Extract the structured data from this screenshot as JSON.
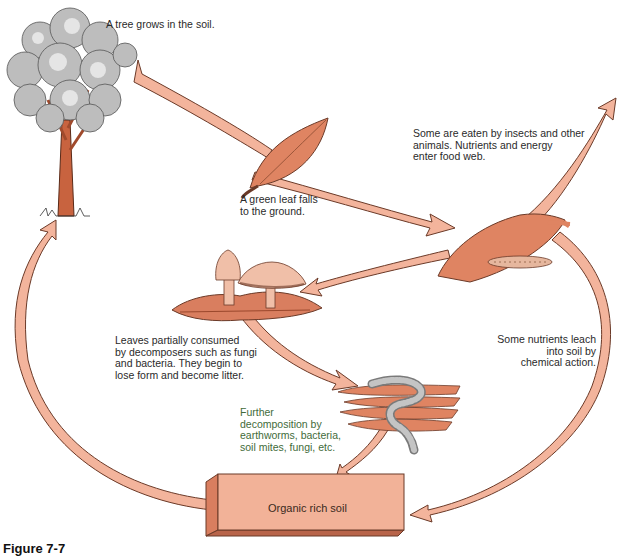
{
  "diagram": {
    "colors": {
      "arrow_fill": "#f3b49c",
      "arrow_stroke": "#6b3a28",
      "leaf_fill": "#df8462",
      "trunk_fill": "#c8633f",
      "foliage_fill": "#b8b8b8",
      "soil_box_front": "#f2b298",
      "soil_box_side": "#d97e5f",
      "worm_fill": "#9a9a9a",
      "text": "#2a2a2a"
    },
    "stages": [
      {
        "id": "tree",
        "label": "A tree grows in the soil."
      },
      {
        "id": "leaf-fall",
        "label": "A green leaf falls\nto the ground."
      },
      {
        "id": "food-web",
        "label": "Some are eaten by insects and other\nanimals. Nutrients and energy\nenter food web."
      },
      {
        "id": "decomposers",
        "label": "Leaves partially consumed\nby decomposers such as fungi\nand bacteria. They begin to\nlose form and become litter."
      },
      {
        "id": "leach",
        "label": "Some nutrients leach\ninto soil by\nchemical action."
      },
      {
        "id": "further",
        "label": "Further\ndecomposition by\nearthworms, bacteria,\nsoil mites, fungi, etc."
      },
      {
        "id": "soil",
        "label": "Organic rich soil"
      }
    ],
    "flows": [
      {
        "from": "tree",
        "to": "leaf-fall"
      },
      {
        "from": "leaf-fall",
        "to": "litter-leaf"
      },
      {
        "from": "litter-leaf",
        "to": "food-web"
      },
      {
        "from": "litter-leaf",
        "to": "decomposers"
      },
      {
        "from": "litter-leaf",
        "to": "soil"
      },
      {
        "from": "decomposers",
        "to": "further"
      },
      {
        "from": "further",
        "to": "soil"
      },
      {
        "from": "soil",
        "to": "tree"
      }
    ],
    "caption": "Figure 7-7"
  }
}
